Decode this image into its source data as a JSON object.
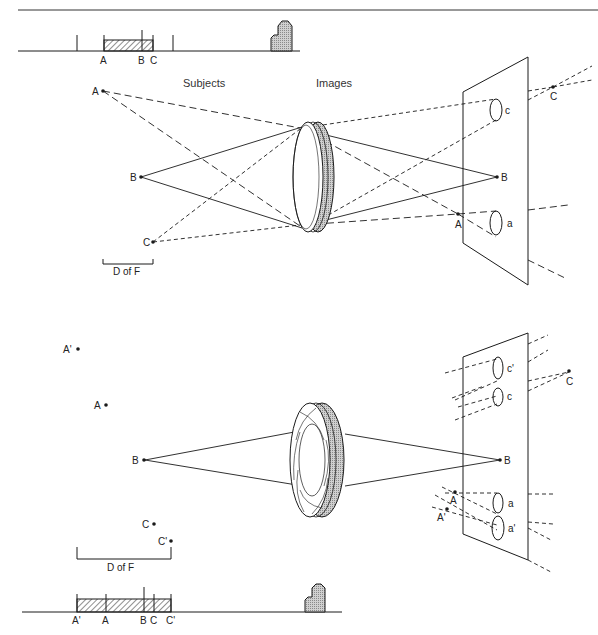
{
  "figure": {
    "top_panel": {
      "headers": {
        "subjects": "Subjects",
        "images": "Images"
      },
      "scale_bar": {
        "labels": [
          "A",
          "B",
          "C"
        ]
      },
      "subject_points": {
        "a": "A",
        "b": "B",
        "c": "C"
      },
      "image_points": {
        "a": "A",
        "b": "B",
        "c": "C"
      },
      "blur_circles": {
        "c": "c",
        "a": "a"
      },
      "dof_label": "D of F"
    },
    "bottom_panel": {
      "scale_bar": {
        "labels": [
          "A'",
          "A",
          "B",
          "C",
          "C'"
        ]
      },
      "subject_points": {
        "a_prime": "A'",
        "a": "A",
        "b": "B",
        "c": "C",
        "c_prime": "C'"
      },
      "image_points": {
        "a": "A",
        "a_prime": "A'",
        "b": "B",
        "c": "C"
      },
      "blur_circles": {
        "c_prime": "c'",
        "c": "c",
        "a": "a",
        "a_prime": "a'"
      },
      "dof_label": "D of F"
    }
  },
  "colors": {
    "line": "#1a1a1a",
    "hatch": "#555555",
    "fill_grey": "#bdbdbd",
    "background": "#ffffff"
  }
}
